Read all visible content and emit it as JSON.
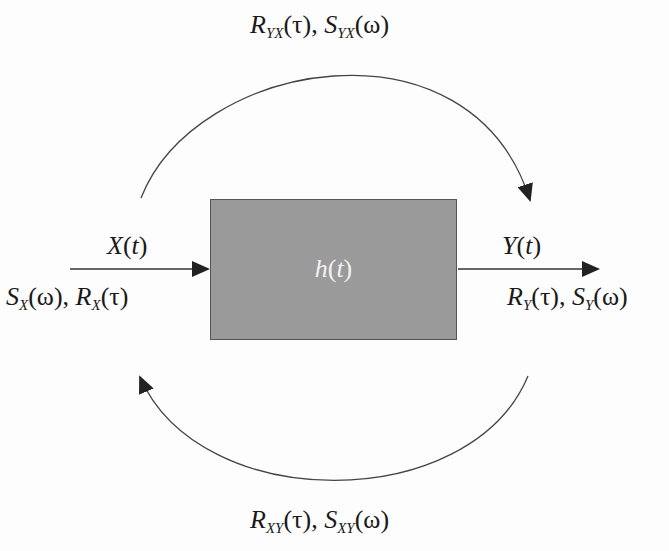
{
  "diagram": {
    "system": {
      "name": "h",
      "arg": "t",
      "fill": "#9a9a9a",
      "text_color": "#f2f2f2"
    },
    "input": {
      "signal": {
        "name": "X",
        "arg": "t"
      },
      "spectra": {
        "s_name": "S",
        "s_sub": "X",
        "s_arg": "(ω)",
        "sep": ", ",
        "r_name": "R",
        "r_sub": "X",
        "r_arg": "(τ)"
      }
    },
    "output": {
      "signal": {
        "name": "Y",
        "arg": "t"
      },
      "spectra": {
        "r_name": "R",
        "r_sub": "Y",
        "r_arg": "(τ)",
        "sep": ", ",
        "s_name": "S",
        "s_sub": "Y",
        "s_arg": "(ω)"
      }
    },
    "top_arc": {
      "r_name": "R",
      "r_sub": "YX",
      "r_arg": "(τ)",
      "sep": ", ",
      "s_name": "S",
      "s_sub": "YX",
      "s_arg": "(ω)"
    },
    "bottom_arc": {
      "r_name": "R",
      "r_sub": "XY",
      "r_arg": "(τ)",
      "sep": ", ",
      "s_name": "S",
      "s_sub": "XY",
      "s_arg": "(ω)"
    },
    "line_color": "#333333"
  }
}
